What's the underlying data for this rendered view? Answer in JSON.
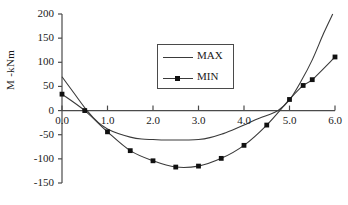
{
  "chart_data": {
    "type": "line",
    "title": "",
    "xlabel": "",
    "ylabel": "M -kNm",
    "xlim": [
      0.0,
      6.0
    ],
    "ylim": [
      -150,
      200
    ],
    "xticks": [
      "0.0",
      "1.0",
      "2.0",
      "3.0",
      "4.0",
      "5.0",
      "6.0"
    ],
    "yticks": [
      "200",
      "150",
      "100",
      "50",
      "0",
      "-50",
      "-100",
      "-150"
    ],
    "grid": false,
    "legend_position": "upper-center",
    "series": [
      {
        "name": "MAX",
        "marker": "none",
        "x": [
          0.0,
          0.25,
          0.55,
          0.8,
          1.0,
          1.25,
          1.5,
          1.75,
          2.0,
          2.25,
          2.5,
          2.75,
          3.0,
          3.25,
          3.5,
          3.75,
          4.0,
          4.25,
          4.5,
          4.75,
          5.0,
          5.25,
          5.5,
          5.75,
          5.95
        ],
        "values": [
          70,
          38,
          0,
          -25,
          -38,
          -48,
          -55,
          -59,
          -60,
          -61,
          -61,
          -61,
          -60,
          -56,
          -49,
          -40,
          -30,
          -19,
          -10,
          0,
          22,
          60,
          105,
          160,
          200
        ]
      },
      {
        "name": "MIN",
        "marker": "square",
        "x": [
          0.0,
          0.5,
          1.0,
          1.5,
          2.0,
          2.5,
          3.0,
          3.5,
          4.0,
          4.5,
          5.0,
          5.3,
          5.5,
          6.0
        ],
        "values": [
          34,
          0,
          -44,
          -83,
          -104,
          -117,
          -115,
          -99,
          -72,
          -30,
          23,
          52,
          64,
          111
        ]
      }
    ]
  },
  "legend": {
    "entries": [
      {
        "label": "MAX"
      },
      {
        "label": "MIN"
      }
    ]
  }
}
